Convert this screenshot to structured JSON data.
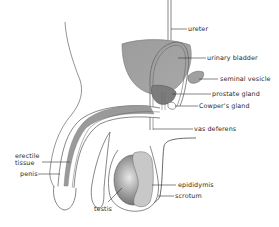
{
  "diagram": {
    "colors": {
      "line": "#555555",
      "fill_gray": "#9a9a9a",
      "fill_dark": "#7a7a7a",
      "background": "#ffffff"
    },
    "labels": {
      "ureter": "ureter",
      "urinary_bladder": "urinary bladder",
      "seminal_vesicle": "seminal vesicle",
      "prostate_gland": "prostate gland",
      "cowpers_gland": "Cowper's gland",
      "vas_deferens": "vas deferens",
      "epididymis": "epididymis",
      "scrotum": "scrotum",
      "testis": "testis",
      "erectile_tissue_line1": "erectile",
      "erectile_tissue_line2": "tissue",
      "penis": "penis"
    }
  }
}
